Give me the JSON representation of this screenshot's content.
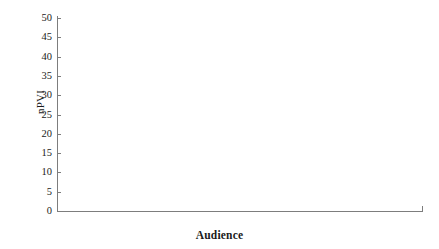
{
  "chart_data": {
    "type": "bar",
    "title": "",
    "xlabel": "Audience",
    "ylabel": "nPVI",
    "categories": [
      "Adults",
      "Children"
    ],
    "series": [
      {
        "name": "English",
        "color": "#9e9e9e",
        "values": [
          42.2,
          42.2
        ],
        "errors": [
          2.0,
          2.5
        ]
      },
      {
        "name": "French",
        "color": "#dcdcdc",
        "values": [
          40.4,
          34.5
        ],
        "errors": [
          2.0,
          2.2
        ]
      }
    ],
    "ylim": [
      0,
      50
    ],
    "yticks": [
      0,
      5,
      10,
      15,
      20,
      25,
      30,
      35,
      40,
      45,
      50
    ],
    "ytick_labels": [
      "0",
      "5",
      "10",
      "15",
      "20",
      "25",
      "30",
      "35",
      "40",
      "45",
      "50"
    ],
    "grid": false,
    "legend_position": "top-right",
    "error_bar_type": "standard-error"
  },
  "axis": {
    "ylabel": "nPVI",
    "xlabel": "Audience"
  },
  "legend": {
    "items": [
      {
        "label": "English",
        "color": "#9e9e9e"
      },
      {
        "label": "French",
        "color": "#dcdcdc"
      }
    ]
  },
  "ticks": {
    "y": [
      "50",
      "45",
      "40",
      "35",
      "30",
      "25",
      "20",
      "15",
      "10",
      "5",
      "0"
    ]
  },
  "categories": [
    {
      "label": "Adults"
    },
    {
      "label": "Children"
    }
  ]
}
